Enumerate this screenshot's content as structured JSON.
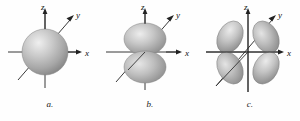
{
  "figure": {
    "background_color": "#fefefe",
    "orbital_fill_light": "#e6e6e6",
    "orbital_fill_mid": "#b5b5b5",
    "orbital_fill_dark": "#8c8c8c",
    "axis_color": "#222222",
    "label_color": "#111111"
  },
  "panels": [
    {
      "id": "a",
      "caption": "a.",
      "orbital_type": "s",
      "lobe_count": 1,
      "description": "sphere centered at origin",
      "axes": {
        "z": "z",
        "y": "y",
        "x": "x"
      }
    },
    {
      "id": "b",
      "caption": "b.",
      "orbital_type": "p",
      "lobe_count": 2,
      "description": "two lobes along the z axis",
      "axes": {
        "z": "z",
        "y": "y",
        "x": "x"
      }
    },
    {
      "id": "c",
      "caption": "c.",
      "orbital_type": "d",
      "lobe_count": 4,
      "description": "four cloverleaf lobes in the xz plane",
      "axes": {
        "z": "z",
        "y": "y",
        "x": "x"
      }
    }
  ]
}
